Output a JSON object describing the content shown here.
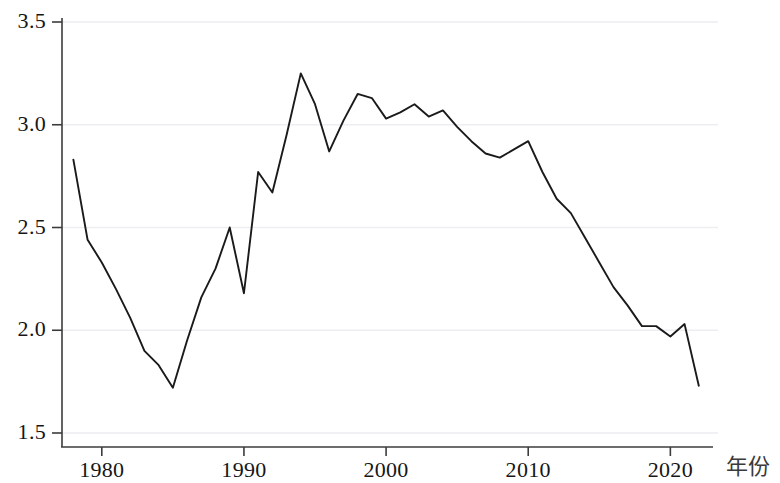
{
  "chart_data": {
    "type": "line",
    "title": "",
    "subtitle": "",
    "xlabel": "年份",
    "ylabel": "",
    "grid": true,
    "legend": null,
    "xlim": [
      1977.2,
      2023.0
    ],
    "ylim": [
      1.5,
      3.5
    ],
    "xticks": [
      1980,
      1990,
      2000,
      2010,
      2020
    ],
    "xtick_labels": [
      "1980",
      "1990",
      "2000",
      "2010",
      "2020"
    ],
    "yticks": [
      1.5,
      2.0,
      2.5,
      3.0,
      3.5
    ],
    "ytick_labels": [
      "1.5",
      "2.0",
      "2.5",
      "3.0",
      "3.5"
    ],
    "line_color": "#1a1a1a",
    "grid_color": "#ededf2",
    "axis_color": "#3c3c3c",
    "series": [
      {
        "name": "series-1",
        "x": [
          1978,
          1979,
          1980,
          1981,
          1982,
          1983,
          1984,
          1985,
          1986,
          1987,
          1988,
          1989,
          1990,
          1991,
          1992,
          1993,
          1994,
          1995,
          1996,
          1997,
          1998,
          1999,
          2000,
          2001,
          2002,
          2003,
          2004,
          2005,
          2006,
          2007,
          2008,
          2009,
          2010,
          2011,
          2012,
          2013,
          2014,
          2015,
          2016,
          2017,
          2018,
          2019,
          2020,
          2021,
          2022
        ],
        "values": [
          2.83,
          2.44,
          2.33,
          2.2,
          2.06,
          1.9,
          1.83,
          1.72,
          1.95,
          2.16,
          2.3,
          2.5,
          2.18,
          2.77,
          2.67,
          2.95,
          3.25,
          3.1,
          2.87,
          3.02,
          3.15,
          3.13,
          3.03,
          3.06,
          3.1,
          3.04,
          3.07,
          2.99,
          2.92,
          2.86,
          2.84,
          2.88,
          2.92,
          2.77,
          2.64,
          2.57,
          2.45,
          2.33,
          2.21,
          2.12,
          2.02,
          2.02,
          1.97,
          2.03,
          1.73
        ]
      }
    ]
  }
}
